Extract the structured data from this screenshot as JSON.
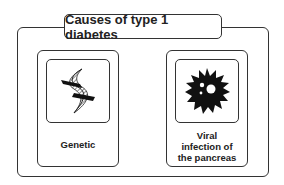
{
  "diagram": {
    "title": "Causes of type 1 diabetes",
    "causes": [
      {
        "label": "Genetic",
        "icon": "dna-helix-icon"
      },
      {
        "label_lines": [
          "Viral",
          "infection of",
          "the pancreas"
        ],
        "icon": "virus-icon"
      }
    ]
  }
}
